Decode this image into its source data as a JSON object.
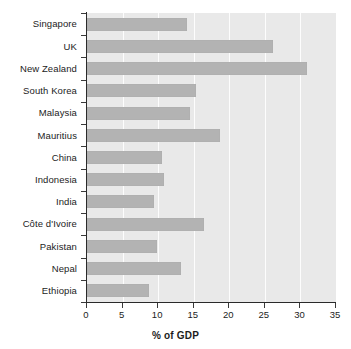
{
  "chart_data": {
    "type": "bar",
    "orientation": "horizontal",
    "title": "",
    "subtitle": "",
    "xlabel": "% of GDP",
    "ylabel": "",
    "xlim": [
      0,
      35
    ],
    "ylim": null,
    "xticks": [
      0,
      5,
      10,
      15,
      20,
      25,
      30,
      35
    ],
    "xtick_labels": [
      "0",
      "5",
      "10",
      "15",
      "20",
      "25",
      "30",
      "35"
    ],
    "grid": "vertical-white-gridlines",
    "legend": null,
    "bar_color": "#b3b3b3",
    "plot_background": "#e9e9e9",
    "categories": [
      "Singapore",
      "UK",
      "New Zealand",
      "South Korea",
      "Malaysia",
      "Mauritius",
      "China",
      "Indonesia",
      "India",
      "Côte d'Ivoire",
      "Pakistan",
      "Nepal",
      "Ethiopia"
    ],
    "values": [
      14.1,
      26.2,
      30.9,
      15.3,
      14.5,
      18.7,
      10.6,
      10.8,
      9.4,
      16.5,
      9.9,
      13.2,
      8.7
    ]
  },
  "axis": {
    "x_title": "% of GDP"
  }
}
